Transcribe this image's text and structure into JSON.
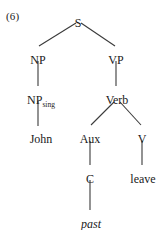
{
  "figure": {
    "example_number": "(6)",
    "type": "syntax-tree",
    "caption": ""
  },
  "tree": {
    "nodes": [
      {
        "id": "S",
        "label": "S",
        "sub": "",
        "x": 78,
        "y": 17
      },
      {
        "id": "NP",
        "label": "NP",
        "sub": "",
        "x": 38,
        "y": 54
      },
      {
        "id": "VP",
        "label": "VP",
        "sub": "",
        "x": 116,
        "y": 54
      },
      {
        "id": "NPsing",
        "label": "NP",
        "sub": "sing",
        "x": 41,
        "y": 94
      },
      {
        "id": "Verb",
        "label": "Verb",
        "sub": "",
        "x": 117,
        "y": 94
      },
      {
        "id": "Aux",
        "label": "Aux",
        "sub": "",
        "x": 90,
        "y": 133
      },
      {
        "id": "V",
        "label": "V",
        "sub": "",
        "x": 142,
        "y": 133
      },
      {
        "id": "C",
        "label": "C",
        "sub": "",
        "x": 90,
        "y": 173
      }
    ],
    "leaves": [
      {
        "id": "john",
        "label": "John",
        "italic": false,
        "x": 41,
        "y": 133
      },
      {
        "id": "leave",
        "label": "leave",
        "italic": false,
        "x": 143,
        "y": 173
      },
      {
        "id": "past",
        "label": "past",
        "italic": true,
        "x": 91,
        "y": 218
      }
    ],
    "edges": [
      {
        "from": "S",
        "to": "NP",
        "x1": 76,
        "y1": 23,
        "x2": 39,
        "y2": 46
      },
      {
        "from": "S",
        "to": "VP",
        "x1": 81,
        "y1": 23,
        "x2": 115,
        "y2": 46
      },
      {
        "from": "NP",
        "to": "NPsing",
        "x1": 38,
        "y1": 61,
        "x2": 38,
        "y2": 86
      },
      {
        "from": "VP",
        "to": "Verb",
        "x1": 116,
        "y1": 61,
        "x2": 116,
        "y2": 86
      },
      {
        "from": "NPsing",
        "to": "john",
        "x1": 38,
        "y1": 101,
        "x2": 38,
        "y2": 126
      },
      {
        "from": "Verb",
        "to": "Aux",
        "x1": 114,
        "y1": 102,
        "x2": 91,
        "y2": 125
      },
      {
        "from": "Verb",
        "to": "V",
        "x1": 120,
        "y1": 102,
        "x2": 141,
        "y2": 125
      },
      {
        "from": "Aux",
        "to": "C",
        "x1": 90,
        "y1": 141,
        "x2": 90,
        "y2": 165
      },
      {
        "from": "V",
        "to": "leave",
        "x1": 142,
        "y1": 141,
        "x2": 142,
        "y2": 165
      },
      {
        "from": "C",
        "to": "past",
        "x1": 90,
        "y1": 180,
        "x2": 90,
        "y2": 210
      }
    ]
  },
  "colors": {
    "background": "#ffffff",
    "text": "#1a1a1a",
    "edge": "#3a3a3a"
  }
}
